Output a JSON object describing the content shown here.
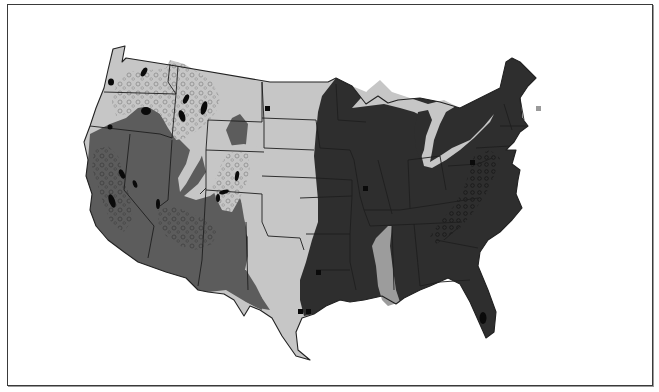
{
  "map": {
    "subject": "Contiguous United States regional zone map (grayscale)",
    "legend": [],
    "zones": [
      {
        "id": "zone-light",
        "label": "Light gray zone (Northern Plains, Pacific NW, Texas, Great Lakes shores, Mississippi corridor)",
        "color": "#c6c6c6"
      },
      {
        "id": "zone-medium",
        "label": "Medium gray zone (Southwest / Great Basin)",
        "color": "#5c5c5c"
      },
      {
        "id": "zone-dark",
        "label": "Dark zone (Eastern US)",
        "color": "#2e2e2e"
      },
      {
        "id": "zone-pattern",
        "label": "Stippled / circle-pattern areas (mountain regions, Appalachians)",
        "color": "#9a9a9a"
      },
      {
        "id": "zone-spot",
        "label": "Black spots (isolated sites)",
        "color": "#0a0a0a"
      }
    ],
    "frame_color": "#3a3a3a",
    "background": "#ffffff"
  }
}
